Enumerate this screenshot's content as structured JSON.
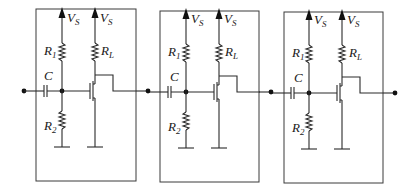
{
  "diagram": {
    "stages": [
      {
        "id": 1,
        "labels": {
          "supply_bias": "V",
          "supply_bias_sub": "S",
          "supply_load": "V",
          "supply_load_sub": "S",
          "r1": "R",
          "r1_sub": "1",
          "rl": "R",
          "rl_sub": "L",
          "r2": "R",
          "r2_sub": "2",
          "cap": "C"
        }
      },
      {
        "id": 2,
        "labels": {
          "supply_bias": "V",
          "supply_bias_sub": "S",
          "supply_load": "V",
          "supply_load_sub": "S",
          "r1": "R",
          "r1_sub": "1",
          "rl": "R",
          "rl_sub": "L",
          "r2": "R",
          "r2_sub": "2",
          "cap": "C"
        }
      },
      {
        "id": 3,
        "labels": {
          "supply_bias": "V",
          "supply_bias_sub": "S",
          "supply_load": "V",
          "supply_load_sub": "S",
          "r1": "R",
          "r1_sub": "1",
          "rl": "R",
          "rl_sub": "L",
          "r2": "R",
          "r2_sub": "2",
          "cap": "C"
        }
      }
    ],
    "components": [
      "input node",
      "coupling capacitor C",
      "bias resistor R1",
      "bias resistor R2",
      "load resistor RL",
      "MOSFET",
      "ground",
      "supply VS",
      "output node"
    ]
  }
}
